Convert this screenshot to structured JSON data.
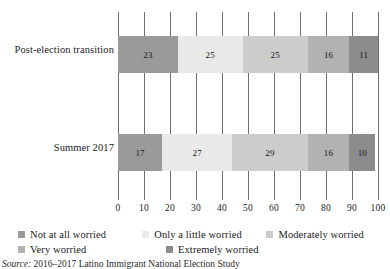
{
  "chart_data": {
    "type": "bar",
    "orientation": "horizontal",
    "stacked": true,
    "normalized": "percent",
    "title": "",
    "subtitle": "",
    "xlabel": "",
    "ylabel": "",
    "xlim": [
      0,
      100
    ],
    "grid": true,
    "legend_position": "bottom",
    "categories": [
      "Post-election transition",
      "Summer 2017"
    ],
    "xticks": [
      0,
      10,
      20,
      30,
      40,
      50,
      60,
      70,
      80,
      90,
      100
    ],
    "xtick_labels": [
      "0",
      "10",
      "20",
      "30",
      "40",
      "50",
      "60",
      "70",
      "80",
      "90",
      "100"
    ],
    "series": [
      {
        "name": "Not at all worried",
        "color": "#9a9a9a",
        "values": [
          23,
          17
        ],
        "labels": [
          "23",
          "17"
        ]
      },
      {
        "name": "Only a little worried",
        "color": "#e9e9e9",
        "values": [
          25,
          27
        ],
        "labels": [
          "25",
          "27"
        ]
      },
      {
        "name": "Moderately worried",
        "color": "#cccccc",
        "values": [
          25,
          29
        ],
        "labels": [
          "25",
          "29"
        ]
      },
      {
        "name": "Very worried",
        "color": "#b2b2b2",
        "values": [
          16,
          16
        ],
        "labels": [
          "16",
          "16"
        ]
      },
      {
        "name": "Extremely worried",
        "color": "#8c8c8c",
        "values": [
          11,
          10
        ],
        "labels": [
          "11",
          "10"
        ]
      }
    ],
    "bars": [
      {
        "category": "Post-election transition",
        "segments": [
          {
            "name": "Not at all worried",
            "value": 23,
            "label": "23",
            "color": "#9a9a9a"
          },
          {
            "name": "Only a little worried",
            "value": 25,
            "label": "25",
            "color": "#e9e9e9"
          },
          {
            "name": "Moderately worried",
            "value": 25,
            "label": "25",
            "color": "#cccccc"
          },
          {
            "name": "Very worried",
            "value": 16,
            "label": "16",
            "color": "#b2b2b2"
          },
          {
            "name": "Extremely worried",
            "value": 11,
            "label": "11",
            "color": "#8c8c8c"
          }
        ]
      },
      {
        "category": "Summer 2017",
        "segments": [
          {
            "name": "Not at all worried",
            "value": 17,
            "label": "17",
            "color": "#9a9a9a"
          },
          {
            "name": "Only a little worried",
            "value": 27,
            "label": "27",
            "color": "#e9e9e9"
          },
          {
            "name": "Moderately worried",
            "value": 29,
            "label": "29",
            "color": "#cccccc"
          },
          {
            "name": "Very worried",
            "value": 16,
            "label": "16",
            "color": "#b2b2b2"
          },
          {
            "name": "Extremely worried",
            "value": 10,
            "label": "10",
            "color": "#8c8c8c"
          }
        ]
      }
    ]
  },
  "legend": {
    "rows": [
      [
        {
          "label": "Not at all worried",
          "color": "#9a9a9a"
        },
        {
          "label": "Only a little worried",
          "color": "#e9e9e9"
        },
        {
          "label": "Moderately worried",
          "color": "#cccccc"
        }
      ],
      [
        {
          "label": "Very worried",
          "color": "#b2b2b2"
        },
        {
          "label": "Extremely worried",
          "color": "#8c8c8c"
        }
      ]
    ]
  },
  "source": {
    "prefix": "Source:",
    "text": " 2016–2017 Latino Immigrant National Election Study"
  },
  "style": {
    "gridline_color": "#6f6f6f",
    "text_color": "#1a1a1a",
    "background": "#ffffff"
  }
}
